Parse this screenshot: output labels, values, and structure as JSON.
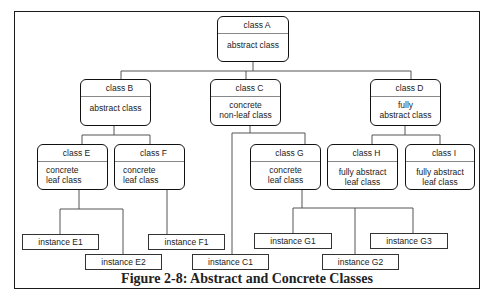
{
  "diagram": {
    "caption": "Figure 2-8: Abstract and Concrete Classes",
    "classes": {
      "A": {
        "name": "class A",
        "desc1": "abstract class",
        "desc2": ""
      },
      "B": {
        "name": "class B",
        "desc1": "abstract class",
        "desc2": ""
      },
      "C": {
        "name": "class C",
        "desc1": "concrete",
        "desc2": "non-leaf class"
      },
      "D": {
        "name": "class D",
        "desc1": "fully",
        "desc2": "abstract class"
      },
      "E": {
        "name": "class E",
        "desc1": "concrete",
        "desc2": "leaf class"
      },
      "F": {
        "name": "class F",
        "desc1": "concrete",
        "desc2": "leaf class"
      },
      "G": {
        "name": "class G",
        "desc1": "concrete",
        "desc2": "leaf class"
      },
      "H": {
        "name": "class H",
        "desc1": "fully abstract",
        "desc2": "leaf class"
      },
      "I": {
        "name": "class I",
        "desc1": "fully abstract",
        "desc2": "leaf class"
      }
    },
    "instances": {
      "E1": "instance E1",
      "E2": "instance E2",
      "F1": "instance F1",
      "C1": "instance C1",
      "G1": "instance G1",
      "G2": "instance G2",
      "G3": "instance G3"
    },
    "hierarchy": [
      {
        "parent": "class A",
        "children": [
          "class B",
          "class C",
          "class D"
        ]
      },
      {
        "parent": "class B",
        "children": [
          "class E",
          "class F"
        ]
      },
      {
        "parent": "class C",
        "children": [
          "class G",
          "instance C1"
        ]
      },
      {
        "parent": "class D",
        "children": [
          "class H",
          "class I"
        ]
      },
      {
        "parent": "class E",
        "children": [
          "instance E1",
          "instance E2"
        ]
      },
      {
        "parent": "class F",
        "children": [
          "instance F1"
        ]
      },
      {
        "parent": "class G",
        "children": [
          "instance G1",
          "instance G2",
          "instance G3"
        ]
      }
    ],
    "colors": {
      "border": "#111111",
      "connector": "#555555",
      "background": "#ffffff",
      "text": "#222222"
    }
  }
}
